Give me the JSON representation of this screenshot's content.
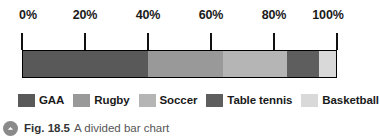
{
  "figure": {
    "caption_number": "Fig. 18.5",
    "caption_text": "A divided bar chart",
    "caption_icon": "chevron-up-circle-icon"
  },
  "colors": {
    "gaa": "#595959",
    "rugby": "#999999",
    "soccer": "#b5b5b5",
    "table_tennis": "#5e5e5e",
    "basketball": "#d9d9d9",
    "axis": "#111111",
    "text": "#1a1a1a"
  },
  "legend": {
    "items": [
      {
        "label": "GAA",
        "color": "#595959"
      },
      {
        "label": "Rugby",
        "color": "#999999"
      },
      {
        "label": "Soccer",
        "color": "#b5b5b5"
      },
      {
        "label": "Table tennis",
        "color": "#5e5e5e"
      },
      {
        "label": "Basketball",
        "color": "#d9d9d9"
      }
    ]
  },
  "chart_data": {
    "type": "bar",
    "orientation": "horizontal",
    "stacked": true,
    "title": "A divided bar chart",
    "xlabel": "",
    "ylabel": "",
    "xlim": [
      0,
      100
    ],
    "grid": false,
    "legend_position": "bottom",
    "axis_unit": "%",
    "tick_labels": [
      "0%",
      "20%",
      "40%",
      "60%",
      "80%",
      "100%"
    ],
    "tick_values": [
      0,
      20,
      40,
      60,
      80,
      100
    ],
    "categories": [
      "GAA",
      "Rugby",
      "Soccer",
      "Table tennis",
      "Basketball"
    ],
    "values": [
      40,
      24,
      20.5,
      10,
      5.5
    ],
    "cumulative": [
      40,
      64,
      84.5,
      94.5,
      100
    ],
    "series": [
      {
        "name": "GAA",
        "value": 40,
        "start": 0,
        "end": 40,
        "color": "#595959"
      },
      {
        "name": "Rugby",
        "value": 24,
        "start": 40,
        "end": 64,
        "color": "#999999"
      },
      {
        "name": "Soccer",
        "value": 20.5,
        "start": 64,
        "end": 84.5,
        "color": "#b5b5b5"
      },
      {
        "name": "Table tennis",
        "value": 10,
        "start": 84.5,
        "end": 94.5,
        "color": "#5e5e5e"
      },
      {
        "name": "Basketball",
        "value": 5.5,
        "start": 94.5,
        "end": 100,
        "color": "#d9d9d9"
      }
    ]
  }
}
